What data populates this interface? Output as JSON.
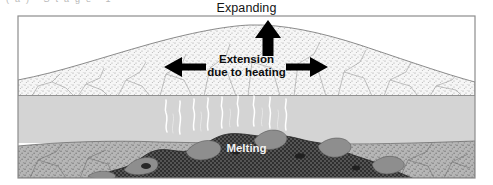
{
  "figure": {
    "title_clipped_fragment": "(a)  Stage 1",
    "labels": {
      "expanding": "Expanding",
      "extension_line1": "Extension",
      "extension_line2": "due to heating",
      "melting": "Melting"
    },
    "arrows": [
      {
        "name": "up-arrow-expanding",
        "direction": "up",
        "x": 268,
        "y": 27
      },
      {
        "name": "left-arrow-extension",
        "direction": "left",
        "x": 184,
        "y": 67
      },
      {
        "name": "right-arrow-extension",
        "direction": "right",
        "x": 308,
        "y": 67
      }
    ],
    "layers": [
      {
        "name": "upper-crust-stippled-dome",
        "label": "upper crust (stippled, domed / arched upward)",
        "fill": "#f4f4f4",
        "pattern": "stipple",
        "has_fractures": true
      },
      {
        "name": "middle-layer-grey",
        "label": "middle layer (plain light grey)",
        "fill": "#d4d4d4",
        "pattern": "solid",
        "top": 95,
        "bottom": 142
      },
      {
        "name": "lower-layer-stippled",
        "label": "lower layer (darker stipple)",
        "fill": "#b0b0b0",
        "pattern": "stipple",
        "top": 142,
        "bottom": 178
      },
      {
        "name": "melt-body",
        "label": "melt body (dark mottled / checkered mass)",
        "fill": "#3a3a3a",
        "pattern": "checker"
      }
    ],
    "plumes": {
      "name": "melt-plumes",
      "label": "wispy white plume lines rising from melt body",
      "count": 9,
      "color": "#ffffff"
    },
    "colors": {
      "background": "#ffffff",
      "border": "#8d8d8d",
      "crust_fill": "#f4f4f4",
      "middle_fill": "#d4d4d4",
      "lower_fill": "#b0b0b0",
      "melt_dark": "#3a3a3a",
      "melt_blob": "#909090",
      "arrow": "#000000",
      "text_dark": "#141414",
      "text_light": "#f2f2f2"
    },
    "frame": {
      "x": 18,
      "y": 16,
      "width": 457,
      "height": 162
    }
  }
}
